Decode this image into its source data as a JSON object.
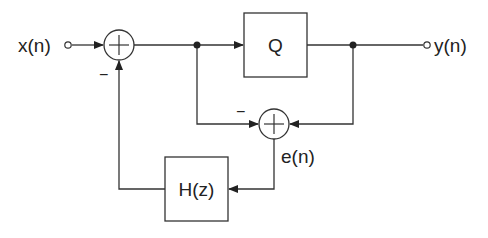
{
  "diagram": {
    "type": "block-diagram",
    "title": "",
    "signals": {
      "input": "x(n)",
      "output": "y(n)",
      "error": "e(n)"
    },
    "blocks": {
      "quantizer": "Q",
      "filter": "H(z)"
    },
    "summing_junctions": [
      {
        "id": "sum1",
        "symbol": "+",
        "inputs": [
          "x(n)",
          "H(z) output (negated)"
        ],
        "minus_label": "−"
      },
      {
        "id": "sum2",
        "symbol": "+",
        "inputs": [
          "Q input (negated)",
          "y(n)"
        ],
        "minus_label": "−"
      }
    ],
    "colors": {
      "line": "#333333",
      "background": "#ffffff"
    }
  }
}
